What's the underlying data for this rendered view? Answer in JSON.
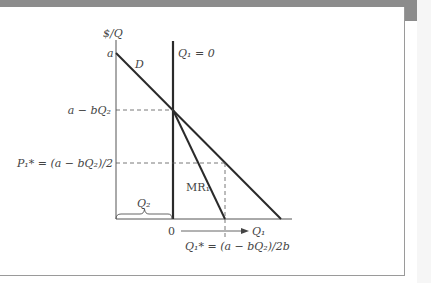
{
  "figure": {
    "axis_y_label": "$/Q",
    "intercept_label": "a",
    "demand_label": "D",
    "q1_zero_label": "Q₁ = 0",
    "residual_price_label": "a − bQ₂",
    "optimal_price_label": "P₁* = (a − bQ₂)/2",
    "mr_label": "MR₁",
    "q2_brace_label": "Q₂",
    "origin_label": "0",
    "x_axis_label": "Q₁",
    "optimal_quantity_label": "Q₁* = (a − bQ₂)/2b"
  },
  "colors": {
    "band": "#8c8c8c",
    "line": "#2a2a2a",
    "axis": "#555555",
    "text": "#444444"
  }
}
